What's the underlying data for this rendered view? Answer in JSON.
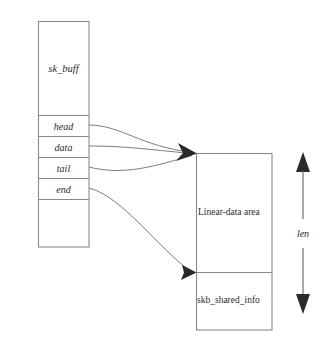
{
  "diagram": {
    "colors": {
      "background": "#ffffff",
      "box_stroke": "#8a8a8a",
      "connector_stroke": "#7d7d7d",
      "arrow_fill": "#2a2a2a",
      "text": "#2b2b2b"
    },
    "skbuff_box": {
      "struct_label": "sk_buff",
      "fields": [
        {
          "label": "head"
        },
        {
          "label": "data"
        },
        {
          "label": "tail"
        },
        {
          "label": "end"
        }
      ]
    },
    "data_box": {
      "linear_label": "Linear-data area",
      "shared_label": "skb_shared_info"
    },
    "length_indicator": {
      "label": "len"
    }
  }
}
